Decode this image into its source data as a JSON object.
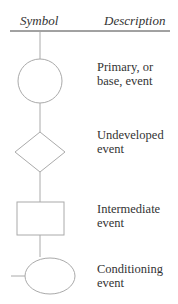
{
  "table": {
    "headers": {
      "symbol": "Symbol",
      "description": "Description"
    },
    "rows": [
      {
        "symbol": "circle",
        "line1": "Primary, or",
        "line2": "base, event"
      },
      {
        "symbol": "diamond",
        "line1": "Undeveloped",
        "line2": "event"
      },
      {
        "symbol": "rectangle",
        "line1": "Intermediate",
        "line2": "event"
      },
      {
        "symbol": "ellipse",
        "line1": "Conditioning",
        "line2": "event"
      }
    ]
  },
  "colors": {
    "line": "#9a9a9a",
    "header_rule": "#444444",
    "text": "#333333"
  }
}
